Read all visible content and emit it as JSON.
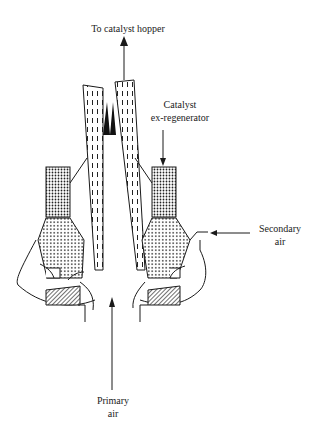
{
  "diagram": {
    "labels": {
      "top": "To catalyst hopper",
      "catalyst_line1": "Catalyst",
      "catalyst_line2": "ex-regenerator",
      "secondary_line1": "Secondary",
      "secondary_line2": "air",
      "primary_line1": "Primary",
      "primary_line2": "air"
    },
    "colors": {
      "stroke": "#1a1a1a",
      "background": "#ffffff"
    }
  }
}
